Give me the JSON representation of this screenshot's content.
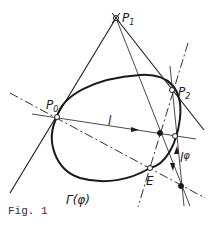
{
  "figure": {
    "caption": "Fig. 1",
    "colors": {
      "ink": "#1a1a1a",
      "background": "#ffffff"
    }
  },
  "labels": {
    "p0": "P",
    "p0_sub": "0",
    "p1": "P",
    "p1_sub": "1",
    "p2": "P",
    "p2_sub": "2",
    "line_l": "l",
    "line_l_phi": "l",
    "line_l_phi_sup": "φ",
    "point_e": "E",
    "curve": "Γ(φ)"
  },
  "points": {
    "P0": {
      "x": 57,
      "y": 117,
      "style": "open"
    },
    "P1": {
      "x": 116,
      "y": 18,
      "style": "open-cross"
    },
    "P2": {
      "x": 172,
      "y": 90,
      "style": "open"
    },
    "E": {
      "x": 150,
      "y": 168,
      "style": "open"
    },
    "X1": {
      "x": 160,
      "y": 133,
      "style": "filled"
    },
    "X2": {
      "x": 175,
      "y": 136,
      "style": "open"
    },
    "X3": {
      "x": 181,
      "y": 186,
      "style": "filled"
    }
  }
}
